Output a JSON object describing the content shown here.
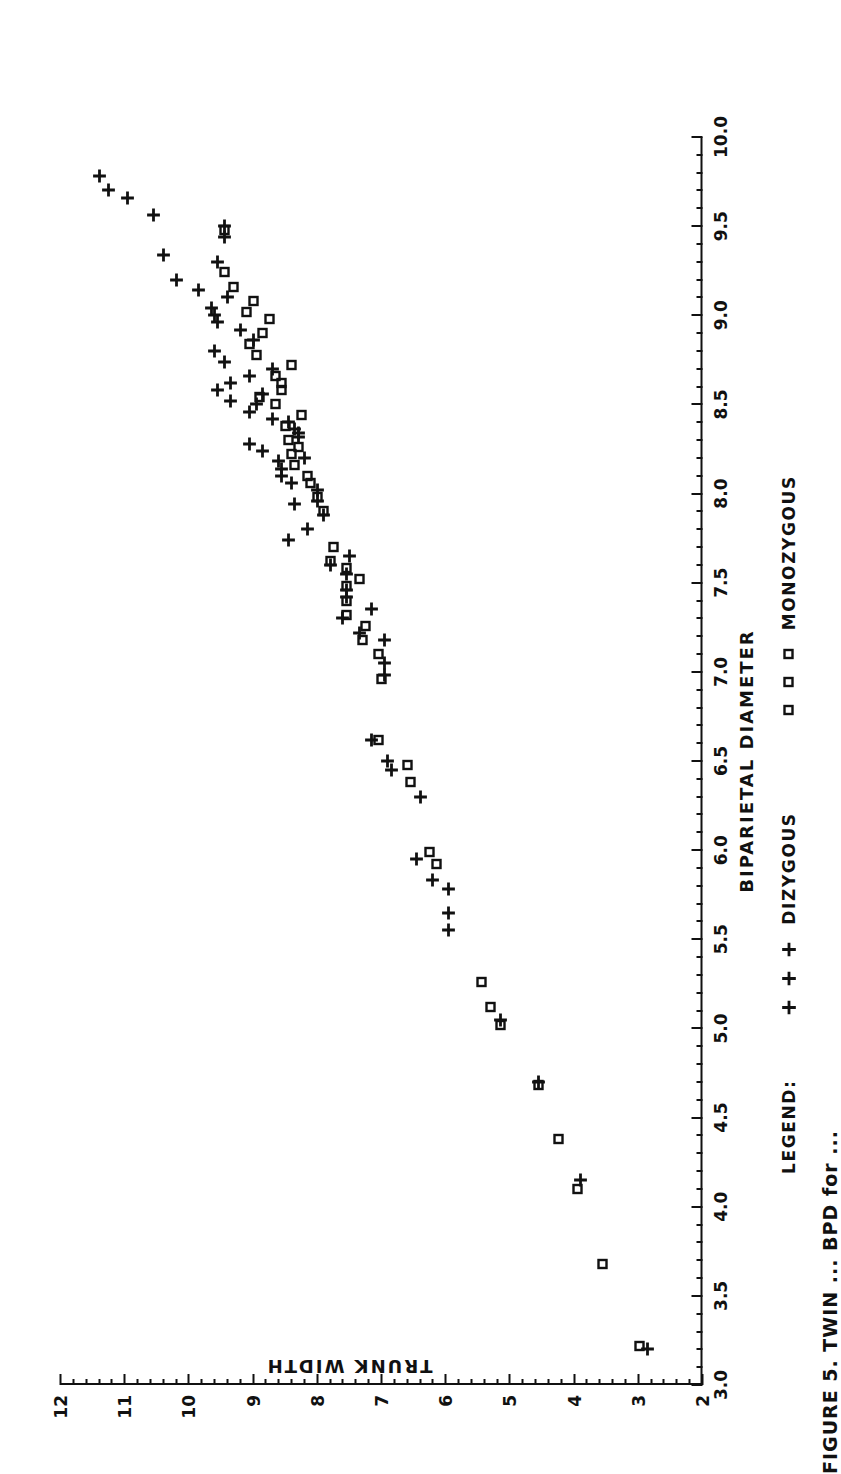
{
  "figure": {
    "caption": "FIGURE 5.  TWIN  ...  BPD for ...",
    "legend_title": "LEGEND:"
  },
  "chart_data": {
    "type": "scatter",
    "title": "",
    "xlabel": "BIPARIETAL DIAMETER",
    "ylabel": "TRUNK WIDTH",
    "xlim": [
      3.0,
      10.0
    ],
    "ylim": [
      2,
      12
    ],
    "grid": false,
    "orientation": "page-rotated-90ccw",
    "legend_position": "below-axes",
    "xticks": [
      3.0,
      3.5,
      4.0,
      4.5,
      5.0,
      5.5,
      6.0,
      6.5,
      7.0,
      7.5,
      8.0,
      8.5,
      9.0,
      9.5,
      10.0
    ],
    "xticklabels": [
      "3.0",
      "3.5",
      "4.0",
      "4.5",
      "5.0",
      "5.5",
      "6.0",
      "6.5",
      "7.0",
      "7.5",
      "8.0",
      "8.5",
      "9.0",
      "9.5",
      "10.0"
    ],
    "xtick_minor_step": 0.1,
    "yticks": [
      2,
      3,
      4,
      5,
      6,
      7,
      8,
      9,
      10,
      11,
      12
    ],
    "yticklabels": [
      "2",
      "3",
      "4",
      "5",
      "6",
      "7",
      "8",
      "9",
      "10",
      "11",
      "12"
    ],
    "ytick_minor_step": 0.2,
    "series": [
      {
        "name": "DIZYGOUS",
        "marker": "plus",
        "color": "#111111",
        "points": [
          [
            3.2,
            2.85
          ],
          [
            4.15,
            3.9
          ],
          [
            4.7,
            4.55
          ],
          [
            5.05,
            5.15
          ],
          [
            5.55,
            5.95
          ],
          [
            5.65,
            5.95
          ],
          [
            5.78,
            5.95
          ],
          [
            5.83,
            6.2
          ],
          [
            5.95,
            6.45
          ],
          [
            6.3,
            6.4
          ],
          [
            6.45,
            6.85
          ],
          [
            6.5,
            6.9
          ],
          [
            6.62,
            7.15
          ],
          [
            6.98,
            6.95
          ],
          [
            7.05,
            6.95
          ],
          [
            7.18,
            6.95
          ],
          [
            7.22,
            7.35
          ],
          [
            7.3,
            7.6
          ],
          [
            7.35,
            7.15
          ],
          [
            7.42,
            7.55
          ],
          [
            7.46,
            7.55
          ],
          [
            7.55,
            7.55
          ],
          [
            7.6,
            7.8
          ],
          [
            7.65,
            7.5
          ],
          [
            7.74,
            8.45
          ],
          [
            7.8,
            8.15
          ],
          [
            7.88,
            7.9
          ],
          [
            7.94,
            8.35
          ],
          [
            7.96,
            8.0
          ],
          [
            8.02,
            8.0
          ],
          [
            8.06,
            8.4
          ],
          [
            8.1,
            8.55
          ],
          [
            8.14,
            8.55
          ],
          [
            8.18,
            8.6
          ],
          [
            8.2,
            8.2
          ],
          [
            8.24,
            8.85
          ],
          [
            8.28,
            9.05
          ],
          [
            8.32,
            8.3
          ],
          [
            8.34,
            8.3
          ],
          [
            8.36,
            8.35
          ],
          [
            8.4,
            8.45
          ],
          [
            8.42,
            8.7
          ],
          [
            8.46,
            9.05
          ],
          [
            8.5,
            8.95
          ],
          [
            8.52,
            9.35
          ],
          [
            8.56,
            8.85
          ],
          [
            8.58,
            9.55
          ],
          [
            8.62,
            9.35
          ],
          [
            8.66,
            9.05
          ],
          [
            8.7,
            8.7
          ],
          [
            8.74,
            9.45
          ],
          [
            8.8,
            9.6
          ],
          [
            8.86,
            9.0
          ],
          [
            8.92,
            9.2
          ],
          [
            8.96,
            9.55
          ],
          [
            9.0,
            9.6
          ],
          [
            9.04,
            9.65
          ],
          [
            9.1,
            9.4
          ],
          [
            9.14,
            9.85
          ],
          [
            9.2,
            10.2
          ],
          [
            9.3,
            9.55
          ],
          [
            9.34,
            10.4
          ],
          [
            9.44,
            9.45
          ],
          [
            9.5,
            9.45
          ],
          [
            9.56,
            10.55
          ],
          [
            9.66,
            10.95
          ],
          [
            9.7,
            11.25
          ],
          [
            9.78,
            11.4
          ]
        ]
      },
      {
        "name": "MONOZYGOUS",
        "marker": "square",
        "color": "#111111",
        "points": [
          [
            3.22,
            2.98
          ],
          [
            3.68,
            3.55
          ],
          [
            4.1,
            3.95
          ],
          [
            4.38,
            4.25
          ],
          [
            4.68,
            4.55
          ],
          [
            5.02,
            5.15
          ],
          [
            5.12,
            5.3
          ],
          [
            5.26,
            5.45
          ],
          [
            5.92,
            6.15
          ],
          [
            5.99,
            6.25
          ],
          [
            6.38,
            6.55
          ],
          [
            6.48,
            6.6
          ],
          [
            6.62,
            7.05
          ],
          [
            6.96,
            7.0
          ],
          [
            7.1,
            7.05
          ],
          [
            7.18,
            7.3
          ],
          [
            7.26,
            7.25
          ],
          [
            7.32,
            7.55
          ],
          [
            7.4,
            7.55
          ],
          [
            7.48,
            7.55
          ],
          [
            7.52,
            7.35
          ],
          [
            7.58,
            7.55
          ],
          [
            7.62,
            7.8
          ],
          [
            7.7,
            7.75
          ],
          [
            7.9,
            7.9
          ],
          [
            7.98,
            8.0
          ],
          [
            8.06,
            8.1
          ],
          [
            8.1,
            8.15
          ],
          [
            8.16,
            8.35
          ],
          [
            8.22,
            8.4
          ],
          [
            8.26,
            8.3
          ],
          [
            8.3,
            8.45
          ],
          [
            8.38,
            8.5
          ],
          [
            8.44,
            8.25
          ],
          [
            8.5,
            8.65
          ],
          [
            8.54,
            8.9
          ],
          [
            8.58,
            8.55
          ],
          [
            8.62,
            8.55
          ],
          [
            8.66,
            8.65
          ],
          [
            8.72,
            8.4
          ],
          [
            8.78,
            8.95
          ],
          [
            8.84,
            9.05
          ],
          [
            8.9,
            8.85
          ],
          [
            8.98,
            8.75
          ],
          [
            9.02,
            9.1
          ],
          [
            9.08,
            9.0
          ],
          [
            9.16,
            9.3
          ],
          [
            9.24,
            9.45
          ],
          [
            9.48,
            9.45
          ]
        ]
      }
    ]
  }
}
